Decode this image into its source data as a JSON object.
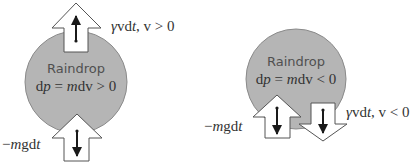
{
  "colors": {
    "drop_fill": "#b5b5b5",
    "drop_stroke": "#8a8a8a",
    "arrow_fill": "#ffffff",
    "arrow_stroke": "#555555",
    "vector": "#1a1a1a"
  },
  "left": {
    "title": "Raindrop",
    "equation": {
      "d": "d",
      "p": "p",
      "eq": " = ",
      "m": "m",
      "dv": "dv",
      "rel": " > 0"
    },
    "drag_label": {
      "gamma": "γ",
      "v": "v",
      "dt": "d",
      "t": "t",
      "sep": ", ",
      "v2": "v",
      "cond": " > 0"
    },
    "gravity_label": {
      "minus": "−",
      "m": "m",
      "g": "g",
      "d": "d",
      "t": "t"
    }
  },
  "right": {
    "title": "Raindrop",
    "equation": {
      "d": "d",
      "p": "p",
      "eq": " = ",
      "m": "m",
      "dv": "dv",
      "rel": " < 0"
    },
    "drag_label": {
      "gamma": "γ",
      "v": "v",
      "dt": "d",
      "t": "t",
      "sep": ", ",
      "v2": "v",
      "cond": " < 0"
    },
    "gravity_label": {
      "minus": "−",
      "m": "m",
      "g": "g",
      "d": "d",
      "t": "t"
    }
  }
}
